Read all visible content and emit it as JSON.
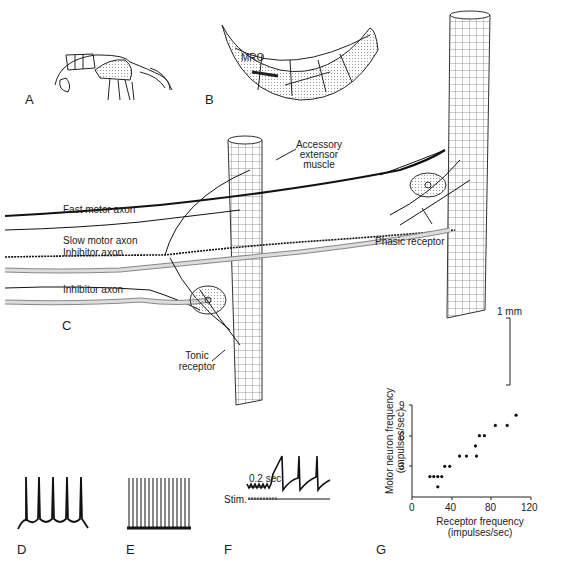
{
  "panels": {
    "A": "A",
    "B": "B",
    "C": "C",
    "D": "D",
    "E": "E",
    "F": "F",
    "G": "G"
  },
  "panel_b": {
    "label": "MRO"
  },
  "panel_c": {
    "labels": {
      "accessory_line1": "Accessory",
      "accessory_line2": "extensor",
      "accessory_line3": "muscle",
      "fast_motor": "Fast motor axon",
      "slow_motor": "Slow motor axon",
      "inhibitor1": "Inhibitor axon",
      "inhibitor2": "Inhibitor axon",
      "phasic": "Phasic receptor",
      "tonic_line1": "Tonic",
      "tonic_line2": "receptor",
      "scale": "1 mm"
    }
  },
  "panel_f": {
    "time_scale": "0.2 sec",
    "stim": "Stim."
  },
  "chart_data": {
    "type": "scatter",
    "title": "",
    "xlabel": "Receptor frequency (impulses/sec)",
    "ylabel": "Motor neuron frequency (impulses/sec)",
    "xlabel_line1": "Receptor frequency",
    "xlabel_line2": "(impulses/sec)",
    "ylabel_line1": "Motor neuron frequency",
    "ylabel_line2": "(impulses/sec)",
    "xlim": [
      0,
      120
    ],
    "ylim": [
      0,
      9
    ],
    "xticks": [
      "0",
      "40",
      "80",
      "120"
    ],
    "yticks": [
      "3",
      "6",
      "9"
    ],
    "grid": false,
    "points": [
      {
        "x": 18,
        "y": 2
      },
      {
        "x": 22,
        "y": 2
      },
      {
        "x": 26,
        "y": 2
      },
      {
        "x": 30,
        "y": 2
      },
      {
        "x": 26,
        "y": 1
      },
      {
        "x": 33,
        "y": 3
      },
      {
        "x": 38,
        "y": 3
      },
      {
        "x": 48,
        "y": 4
      },
      {
        "x": 55,
        "y": 4
      },
      {
        "x": 65,
        "y": 4
      },
      {
        "x": 64,
        "y": 5
      },
      {
        "x": 68,
        "y": 6
      },
      {
        "x": 73,
        "y": 6
      },
      {
        "x": 84,
        "y": 7
      },
      {
        "x": 96,
        "y": 7
      },
      {
        "x": 105,
        "y": 8
      }
    ]
  }
}
